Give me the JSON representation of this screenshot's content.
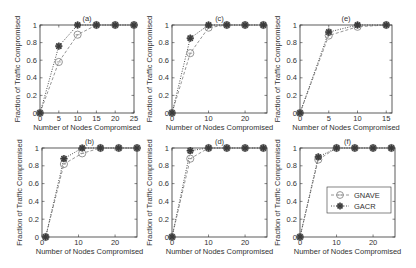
{
  "figure": {
    "xlabel": "Number of Nodes Compromised",
    "ylabel": "Fraction of Traffic Compromised",
    "legend": {
      "gnave": "GNAVE",
      "gacr": "GACR"
    }
  },
  "colors": {
    "gnave": "#8a8a8a",
    "gacr": "#3a3a3a",
    "axis": "#333333"
  },
  "chart_data": [
    {
      "type": "line",
      "title": "(a)",
      "xlabel": "Number of Nodes Compromised",
      "ylabel": "Fraction of Traffic Compromised",
      "xlim": [
        0,
        25
      ],
      "ylim": [
        0,
        1
      ],
      "xticks": [
        0,
        5,
        10,
        15,
        20,
        25
      ],
      "yticks": [
        0,
        0.2,
        0.4,
        0.6,
        0.8,
        1
      ],
      "x": [
        0,
        5,
        10,
        15,
        20,
        25
      ],
      "series": [
        {
          "name": "GNAVE",
          "values": [
            0,
            0.58,
            0.89,
            1,
            1,
            1
          ]
        },
        {
          "name": "GACR",
          "values": [
            0,
            0.76,
            1,
            1,
            1,
            1
          ]
        }
      ]
    },
    {
      "type": "line",
      "title": "(c)",
      "xlabel": "Number of Nodes Compromised",
      "ylabel": "Fraction of Traffic Compromised",
      "xlim": [
        0,
        26
      ],
      "ylim": [
        0,
        1
      ],
      "xticks": [
        0,
        10,
        20
      ],
      "yticks": [
        0,
        0.2,
        0.4,
        0.6,
        0.8,
        1
      ],
      "x": [
        0,
        5,
        10,
        15,
        20,
        25
      ],
      "series": [
        {
          "name": "GNAVE",
          "values": [
            0,
            0.68,
            0.97,
            1,
            1,
            1
          ]
        },
        {
          "name": "GACR",
          "values": [
            0,
            0.85,
            1,
            1,
            1,
            1
          ]
        }
      ]
    },
    {
      "type": "line",
      "title": "(e)",
      "xlabel": "Number of Nodes Compromised",
      "ylabel": "Fraction of Traffic Compromised",
      "xlim": [
        0,
        16
      ],
      "ylim": [
        0,
        1
      ],
      "xticks": [
        0,
        5,
        10,
        15
      ],
      "yticks": [
        0,
        0.2,
        0.4,
        0.6,
        0.8,
        1
      ],
      "x": [
        0,
        5,
        10,
        15
      ],
      "series": [
        {
          "name": "GNAVE",
          "values": [
            0,
            0.88,
            0.98,
            1
          ]
        },
        {
          "name": "GACR",
          "values": [
            0,
            0.92,
            1,
            1
          ]
        }
      ]
    },
    {
      "type": "line",
      "title": "(b)",
      "xlabel": "Number of Nodes Compromised",
      "ylabel": "Fraction of Traffic Compromised",
      "xlim": [
        0,
        26
      ],
      "ylim": [
        0,
        1
      ],
      "xticks": [
        0,
        10,
        20
      ],
      "yticks": [
        0,
        0.2,
        0.4,
        0.6,
        0.8,
        1
      ],
      "x": [
        1,
        6,
        11,
        16,
        21,
        26
      ],
      "series": [
        {
          "name": "GNAVE",
          "values": [
            0,
            0.82,
            0.94,
            1,
            1,
            1
          ]
        },
        {
          "name": "GACR",
          "values": [
            0,
            0.88,
            1,
            1,
            1,
            1
          ]
        }
      ]
    },
    {
      "type": "line",
      "title": "(d)",
      "xlabel": "Number of Nodes Compromised",
      "ylabel": "Fraction of Traffic Compromised",
      "xlim": [
        0,
        26
      ],
      "ylim": [
        0,
        1
      ],
      "xticks": [
        0,
        10,
        20
      ],
      "yticks": [
        0,
        0.2,
        0.4,
        0.6,
        0.8,
        1
      ],
      "x": [
        0,
        5,
        10,
        15,
        20,
        25
      ],
      "series": [
        {
          "name": "GNAVE",
          "values": [
            0,
            0.88,
            1,
            1,
            1,
            1
          ]
        },
        {
          "name": "GACR",
          "values": [
            0,
            0.97,
            1,
            1,
            1,
            1
          ]
        }
      ]
    },
    {
      "type": "line",
      "title": "(f)",
      "xlabel": "Number of Nodes Compromised",
      "ylabel": "Fraction of Traffic Compromised",
      "xlim": [
        0,
        26
      ],
      "ylim": [
        0,
        1
      ],
      "xticks": [
        0,
        10,
        20
      ],
      "yticks": [
        0,
        0.2,
        0.4,
        0.6,
        0.8,
        1
      ],
      "x": [
        0,
        5,
        10,
        15,
        20,
        25
      ],
      "series": [
        {
          "name": "GNAVE",
          "values": [
            0,
            0.87,
            1,
            1,
            1,
            1
          ]
        },
        {
          "name": "GACR",
          "values": [
            0,
            0.9,
            1,
            1,
            1,
            1
          ]
        }
      ],
      "legend_position": "lower right"
    }
  ]
}
